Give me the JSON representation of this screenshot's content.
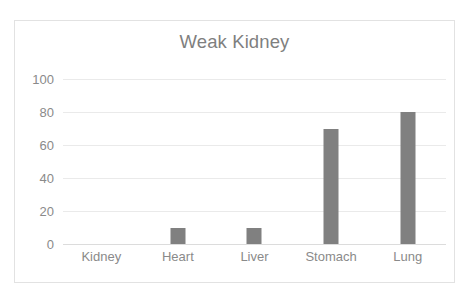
{
  "chart_data": {
    "type": "bar",
    "title": "Weak Kidney",
    "categories": [
      "Kidney",
      "Heart",
      "Liver",
      "Stomach",
      "Lung"
    ],
    "values": [
      0,
      10,
      10,
      70,
      80
    ],
    "xlabel": "",
    "ylabel": "",
    "ylim": [
      0,
      100
    ],
    "yticks": [
      0,
      20,
      40,
      60,
      80,
      100
    ],
    "grid": true,
    "legend": "none",
    "bar_color": "#808080",
    "gridline_color": "#EAEAEA",
    "axis_text_color": "#8A8A8A",
    "title_color": "#7F7F7F",
    "border_color": "#E2E2E2",
    "background": "#FFFFFF"
  }
}
